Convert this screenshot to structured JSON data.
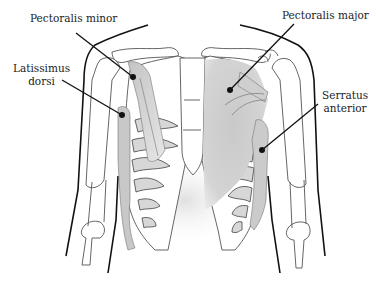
{
  "diagram": {
    "labels": [
      {
        "id": "pectoralis-minor",
        "text": "Pectoralis minor",
        "x": 30,
        "y": 12
      },
      {
        "id": "latissimus-dorsi",
        "line1": "Latissimus",
        "line2": "dorsi",
        "x": 15,
        "y": 63
      },
      {
        "id": "pectoralis-major",
        "text": "Pectoralis major",
        "x": 282,
        "y": 9
      },
      {
        "id": "serratus-anterior",
        "line1": "Serratus",
        "line2": "anterior",
        "x": 322,
        "y": 89
      }
    ],
    "colors": {
      "muscle_shade": "#c8c8c8",
      "outline": "#111111",
      "bone_outline": "#555555",
      "background": "#ffffff"
    }
  }
}
